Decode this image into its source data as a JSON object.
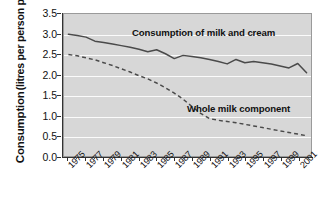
{
  "chart_data": {
    "type": "line",
    "title": "",
    "xlabel": "",
    "ylabel": "Consumption (litres per person per week)",
    "ylabel_line1": "Consumption",
    "ylabel_line2": "(litres per person per week)",
    "ylim": [
      0.0,
      3.5
    ],
    "ytick_labels": [
      "0.0",
      "0.5",
      "1.0",
      "1.5",
      "2.0",
      "2.5",
      "3.0",
      "3.5"
    ],
    "ytick_values": [
      0.0,
      0.5,
      1.0,
      1.5,
      2.0,
      2.5,
      3.0,
      3.5
    ],
    "xlim": [
      1974.5,
      2002.5
    ],
    "xtick_labels": [
      "1975",
      "1977",
      "1979",
      "1981",
      "1983",
      "1985",
      "1987",
      "1989",
      "1991",
      "1993",
      "1995",
      "1997",
      "1999",
      "2001"
    ],
    "xtick_values": [
      1975,
      1977,
      1979,
      1981,
      1983,
      1985,
      1987,
      1989,
      1991,
      1993,
      1995,
      1997,
      1999,
      2001
    ],
    "grid": true,
    "legend_position": "inline-annotation",
    "x": [
      1975,
      1976,
      1977,
      1978,
      1979,
      1980,
      1981,
      1982,
      1983,
      1984,
      1985,
      1986,
      1987,
      1988,
      1989,
      1990,
      1991,
      1992,
      1993,
      1994,
      1995,
      1996,
      1997,
      1998,
      1999,
      2000,
      2001,
      2002
    ],
    "series": [
      {
        "name": "Consumption of milk and cream",
        "style": "solid",
        "color": "#4a4a4a",
        "values": [
          3.0,
          2.97,
          2.93,
          2.83,
          2.8,
          2.76,
          2.72,
          2.68,
          2.63,
          2.57,
          2.62,
          2.52,
          2.4,
          2.48,
          2.45,
          2.42,
          2.38,
          2.33,
          2.27,
          2.38,
          2.3,
          2.33,
          2.3,
          2.27,
          2.22,
          2.17,
          2.28,
          2.05
        ]
      },
      {
        "name": "Whole milk component",
        "style": "dashed",
        "color": "#4a4a4a",
        "values": [
          2.5,
          2.47,
          2.42,
          2.37,
          2.3,
          2.23,
          2.15,
          2.07,
          1.98,
          1.9,
          1.8,
          1.68,
          1.55,
          1.4,
          1.22,
          1.05,
          0.92,
          0.88,
          0.85,
          0.82,
          0.78,
          0.74,
          0.7,
          0.66,
          0.62,
          0.58,
          0.54,
          0.5
        ]
      }
    ],
    "annotations": [
      {
        "text": "Consumption of milk and cream",
        "x": 1984.0,
        "y": 2.95
      },
      {
        "text": "Whole milk component",
        "x": 1991.2,
        "y": 1.28
      }
    ],
    "colors": {
      "plot_background": "#d7d7d7",
      "gridline": "#fbfbfb",
      "axis": "#333333",
      "line": "#4a4a4a",
      "text": "#111111",
      "page_background": "#ffffff"
    }
  }
}
